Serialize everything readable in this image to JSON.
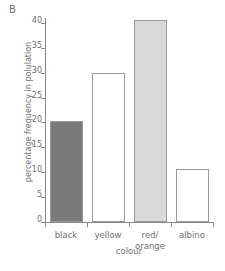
{
  "panel": {
    "label": "B"
  },
  "chart_data": {
    "type": "bar",
    "title": "",
    "subtitle": "",
    "xlabel": "colour",
    "ylabel": "percentage frequency in polulation",
    "categories": [
      "black",
      "yellow",
      "red/\norange",
      "albino"
    ],
    "category_plain": [
      "black",
      "yellow",
      "red/orange",
      "albino"
    ],
    "values": [
      20.2,
      30.0,
      40.5,
      10.7
    ],
    "ylim": [
      0,
      41
    ],
    "yticks": [
      0,
      5,
      10,
      15,
      20,
      25,
      30,
      35,
      40
    ],
    "ytick_labels": [
      "0",
      "5",
      "10",
      "15",
      "20",
      "25",
      "30",
      "35",
      "40"
    ],
    "grid": false,
    "legend": null,
    "bar_fills": [
      "#7a7a7a",
      "#ffffff",
      "#d9d9d9",
      "#ffffff"
    ],
    "bar_edge_color": "#9a9a9a",
    "axis_color": "#8a8a8a",
    "text_color": "#6f6f6f"
  }
}
